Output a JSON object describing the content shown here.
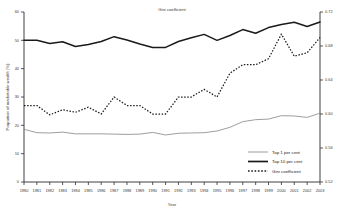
{
  "chart_data": {
    "type": "line",
    "title": "Gini coefficient",
    "xlabel": "Year",
    "ylabel": "Proportion of marketable wealth (%)",
    "y2label": "Gini coefficient",
    "ylim": [
      0,
      60
    ],
    "y2lim": [
      0.52,
      0.72
    ],
    "xlim": [
      1980,
      2003
    ],
    "grid": false,
    "legend_position": "bottom-right",
    "categories": [
      1980,
      1981,
      1982,
      1983,
      1984,
      1985,
      1986,
      1987,
      1988,
      1989,
      1990,
      1991,
      1992,
      1993,
      1994,
      1995,
      1996,
      1997,
      1998,
      1999,
      2000,
      2001,
      2002,
      2003
    ],
    "xticklabels": [
      "1980",
      "1981",
      "1982",
      "1983",
      "1984",
      "1985",
      "1986",
      "1987",
      "1988",
      "1989",
      "1990",
      "1991",
      "1992",
      "1993",
      "1994",
      "1995",
      "1996",
      "1997",
      "1998",
      "1999",
      "2000",
      "2001",
      "2002",
      "2003"
    ],
    "yticklabels": [
      "0",
      "10",
      "20",
      "30",
      "40",
      "50",
      "60"
    ],
    "ytickvalues": [
      0,
      10,
      20,
      30,
      40,
      50,
      60
    ],
    "y2ticklabels": [
      "0.52",
      "0.56",
      "0.60",
      "0.64",
      "0.68",
      "0.72"
    ],
    "y2tickvalues": [
      0.52,
      0.56,
      0.6,
      0.64,
      0.68,
      0.72
    ],
    "series": [
      {
        "name": "Top 1 per cent",
        "axis": "left",
        "style": "thin-solid",
        "color": "#8c8c8c",
        "values": [
          18.6,
          17.4,
          17.3,
          17.6,
          17.0,
          17.0,
          17.0,
          16.9,
          16.8,
          16.9,
          17.5,
          16.6,
          17.2,
          17.3,
          17.4,
          18.0,
          19.3,
          21.3,
          22.0,
          22.2,
          23.4,
          23.3,
          22.8,
          24.3
        ]
      },
      {
        "name": "Top 10 per cent",
        "axis": "left",
        "style": "thick-solid",
        "color": "#1a1a1a",
        "values": [
          50.0,
          50.0,
          48.9,
          49.5,
          47.8,
          48.5,
          49.6,
          51.3,
          50.1,
          48.7,
          47.5,
          47.5,
          49.6,
          50.9,
          52.1,
          50.0,
          51.7,
          53.8,
          52.5,
          54.5,
          55.6,
          56.4,
          54.9,
          56.5
        ]
      },
      {
        "name": "Gini coefficient",
        "axis": "right",
        "style": "dotted",
        "color": "#1a1a1a",
        "values": [
          0.61,
          0.61,
          0.599,
          0.605,
          0.602,
          0.608,
          0.6,
          0.62,
          0.61,
          0.61,
          0.6,
          0.6,
          0.62,
          0.62,
          0.629,
          0.62,
          0.648,
          0.658,
          0.658,
          0.665,
          0.694,
          0.668,
          0.672,
          0.69
        ]
      }
    ]
  },
  "legend": {
    "items": [
      {
        "label": "Top 1 per cent"
      },
      {
        "label": "Top 10 per cent"
      },
      {
        "label": "Gini coefficient"
      }
    ]
  }
}
